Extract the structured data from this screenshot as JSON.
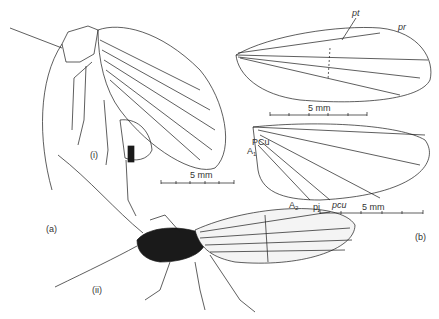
{
  "figure": {
    "panel_a": {
      "label": "(a)",
      "sub_i": "(i)",
      "sub_ii": "(ii)",
      "scale_bar": "5 mm"
    },
    "panel_b": {
      "label": "(b)",
      "forewing": {
        "labels": {
          "pt": "pt",
          "pr": "pr"
        },
        "scale_bar": "5 mm"
      },
      "hindwing": {
        "labels": {
          "PCu": "PCu",
          "A1": "A",
          "A1_sub": "1",
          "A2": "A",
          "A2_sub": "2",
          "pj": "pj",
          "pcu": "pcu"
        },
        "scale_bar": "5 mm"
      }
    },
    "colors": {
      "ink": "#1a1a1a",
      "background": "#ffffff"
    }
  }
}
